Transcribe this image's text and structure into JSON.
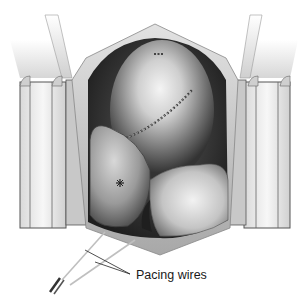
{
  "figure": {
    "annotations": [
      {
        "id": "pacing-wires",
        "text": "Pacing wires"
      }
    ]
  },
  "colors": {
    "background": "#ffffff",
    "cavity_dark": "#2b2b2b",
    "heart_mid": "#8a8a8a",
    "heart_highlight": "#e6e6e6",
    "retractor_face": "#f2f2f2",
    "retractor_edge": "#555555",
    "tissue_edge": "#b8b8b8",
    "label_text": "#1a1a1a"
  }
}
